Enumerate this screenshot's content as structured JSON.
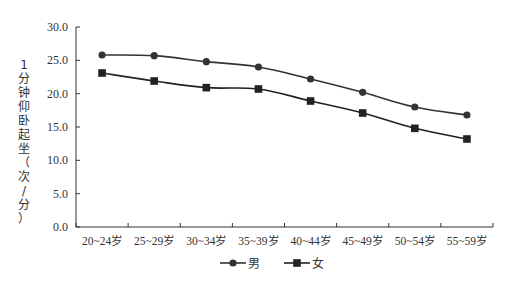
{
  "chart_data": {
    "type": "line",
    "title": "",
    "xlabel": "",
    "ylabel": "1分钟仰卧起坐（次/分）",
    "ylim": [
      0,
      30
    ],
    "yticks": [
      "0.0",
      "5.0",
      "10.0",
      "15.0",
      "20.0",
      "25.0",
      "30.0"
    ],
    "grid": false,
    "legend_position": "bottom",
    "categories": [
      "20~24岁",
      "25~29岁",
      "30~34岁",
      "35~39岁",
      "40~44岁",
      "45~49岁",
      "50~54岁",
      "55~59岁"
    ],
    "series": [
      {
        "name": "男",
        "marker": "circle",
        "color": "#333333",
        "values": [
          25.8,
          25.7,
          24.8,
          24.0,
          22.2,
          20.2,
          18.0,
          16.8
        ]
      },
      {
        "name": "女",
        "marker": "square",
        "color": "#222222",
        "values": [
          23.1,
          21.9,
          20.9,
          20.7,
          18.9,
          17.1,
          14.8,
          13.2
        ]
      }
    ]
  }
}
